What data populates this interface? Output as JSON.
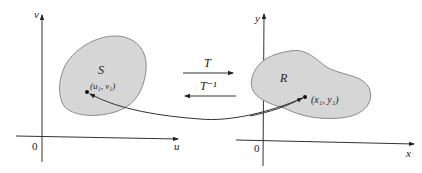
{
  "diagram": {
    "left_plane": {
      "vertical_axis_label": "v",
      "horizontal_axis_label": "u",
      "origin_label": "0",
      "region_label": "S",
      "point_label": "(u₁, v₁)"
    },
    "right_plane": {
      "vertical_axis_label": "y",
      "horizontal_axis_label": "x",
      "origin_label": "0",
      "region_label": "R",
      "point_label": "(x₁, y₁)"
    },
    "transforms": {
      "forward_label": "T",
      "inverse_label": "T⁻¹"
    },
    "colors": {
      "region_fill": "#d6d6d6",
      "region_stroke": "#8a8a8a",
      "axis": "#333333"
    }
  }
}
